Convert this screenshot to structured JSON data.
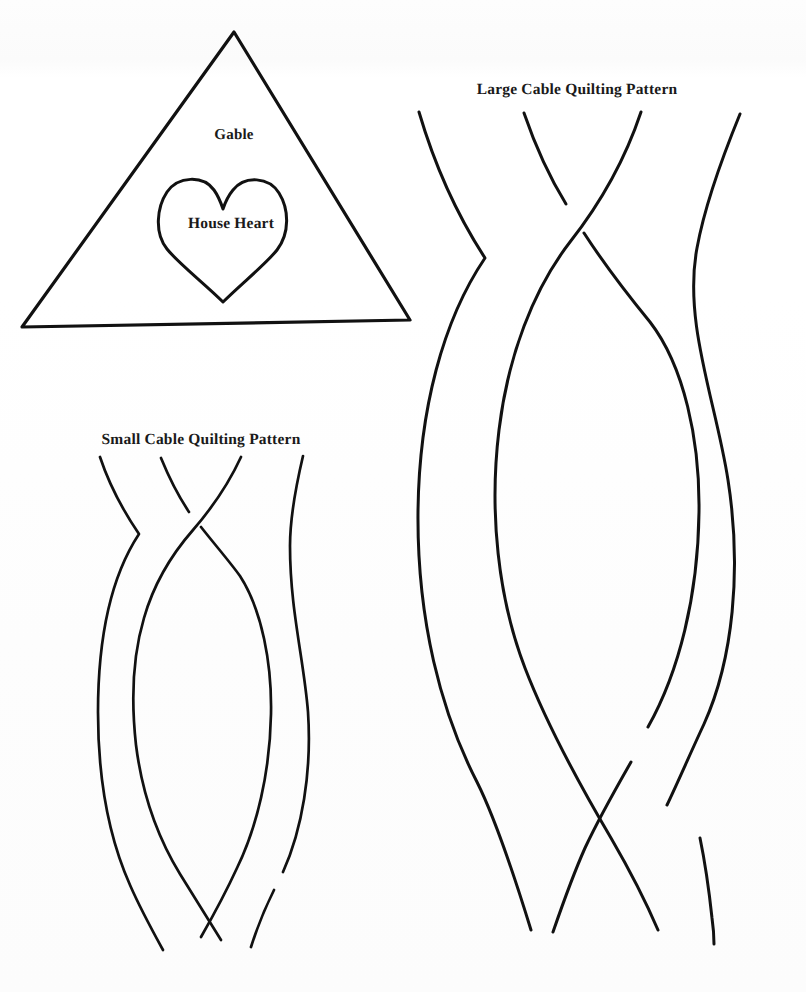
{
  "document": {
    "type": "quilting-pattern-template-sheet",
    "background_color": "#fefefe",
    "ink_color": "#111111",
    "width": 806,
    "height": 992
  },
  "labels": {
    "gable": "Gable",
    "house_heart": "House Heart",
    "large_cable": "Large Cable Quilting Pattern",
    "small_cable": "Small Cable Quilting Pattern"
  },
  "shapes": {
    "gable_triangle": {
      "name": "Gable",
      "kind": "triangle",
      "apex": [
        234,
        32
      ],
      "base_left": [
        22,
        327
      ],
      "base_right": [
        410,
        320
      ],
      "stroke_width": 3
    },
    "house_heart": {
      "name": "House Heart",
      "kind": "heart",
      "center": [
        223,
        238
      ],
      "width": 126,
      "height": 124,
      "stroke_width": 3
    },
    "small_cable": {
      "name": "Small Cable Quilting Pattern",
      "kind": "four-strand-braid",
      "strand_count": 4,
      "top_ends": [
        100,
        161,
        241,
        303
      ],
      "bottom_ends": [
        100,
        172,
        247,
        311
      ],
      "top_y": 455,
      "bottom_y": 955,
      "stroke_width": 2.6
    },
    "large_cable": {
      "name": "Large Cable Quilting Pattern",
      "kind": "four-strand-braid",
      "strand_count": 4,
      "top_ends": [
        419,
        524,
        641,
        740
      ],
      "bottom_ends": [
        421,
        527,
        640,
        742
      ],
      "top_y": 110,
      "bottom_y": 945,
      "stroke_width": 3
    }
  }
}
